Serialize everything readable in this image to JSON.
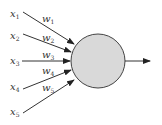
{
  "diagram": {
    "type": "perceptron",
    "inputs": [
      {
        "label": "x",
        "sub": "1",
        "weight": "w",
        "wsub": "1"
      },
      {
        "label": "x",
        "sub": "2",
        "weight": "w",
        "wsub": "2"
      },
      {
        "label": "x",
        "sub": "3",
        "weight": "w",
        "wsub": "3"
      },
      {
        "label": "x",
        "sub": "4",
        "weight": "w",
        "wsub": "4"
      },
      {
        "label": "x",
        "sub": "5",
        "weight": "w",
        "wsub": "5"
      }
    ],
    "node": {
      "fill": "#d9d9d9",
      "stroke": "#444444"
    },
    "output": {
      "arrow": true
    }
  }
}
